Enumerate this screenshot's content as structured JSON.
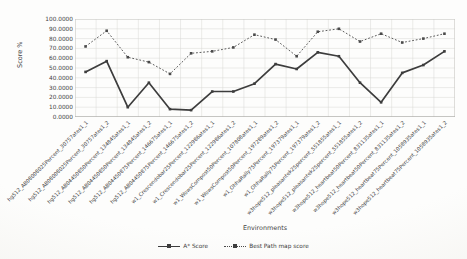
{
  "page": {
    "background": "#fcfcfa"
  },
  "chart_data": {
    "type": "line",
    "title": "",
    "xlabel": "Environments",
    "ylabel": "Score %",
    "ylim": [
      0,
      100
    ],
    "ytick_step": 10,
    "ytick_labels": [
      "100.0000",
      "90.0000",
      "80.0000",
      "70.0000",
      "60.0000",
      "50.0000",
      "40.0000",
      "30.0000",
      "20.0000",
      "10.0000",
      "0.0000"
    ],
    "grid": true,
    "legend_position": "bottom",
    "categories": [
      "hg512_AB08008025Percent_30757ates1_1",
      "hg512_AB08008025Percent_30757ates1_2",
      "hg512_AB04450850Percent_134845ates1_1",
      "hg512_AB04450850Percent_134845ates1_2",
      "hg512_AB04450875Percent_146675ates1_1",
      "hg512_AB04450875Percent_146675ates1_2",
      "w1_Crescendobar25Percent_122986ates1_1",
      "w1_Crescendobar25Percent_122986ates1_2",
      "w1_WowsCompost50Percent_107808ates1_1",
      "w1_WowsCompost50Percent_197289ates1_2",
      "w1_OhhaRally75Percent_197379ates1_1",
      "w1_OhhaRally75Percent_197379ates1_2",
      "w3hope512_pleasantek25percent_551855ates1_1",
      "w3hope512_pleasantek25percent_551855ates1_2",
      "w3hope512_heartbeat50Percent_831135ates1_1",
      "w3hope512_heartbeat50Percent_831135ates1_2",
      "w3hope512_heartbeat75Percent_1058935ates1_1",
      "w3hope512_heartbeat75Percent_1058935ates1_2"
    ],
    "series": [
      {
        "name": "A* Score",
        "line_style": "solid",
        "color": "#3d3d3d",
        "values": [
          46,
          57,
          10,
          35,
          8,
          7,
          26,
          26,
          34,
          54,
          49,
          66,
          62,
          35,
          15,
          45,
          53,
          67
        ]
      },
      {
        "name": "Best Path map score",
        "line_style": "dotted",
        "color": "#4a4a4a",
        "values": [
          72,
          88,
          61,
          56,
          44,
          65,
          67,
          71,
          84,
          79,
          62,
          87,
          90,
          77,
          85,
          76,
          80,
          85
        ]
      }
    ]
  },
  "colors": {
    "grid": "#d9d8d4",
    "plot_border": "#c8c7c3",
    "axis_line": "#9a9a96",
    "text": "#3f3f3f"
  }
}
